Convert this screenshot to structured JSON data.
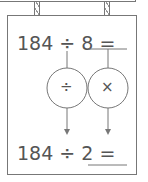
{
  "diagram": {
    "top_equation": "184 ÷ 8 =",
    "bottom_equation": "184 ÷ 2 =",
    "operations": [
      {
        "symbol": "÷",
        "name": "divide"
      },
      {
        "symbol": "×",
        "name": "multiply"
      }
    ],
    "colors": {
      "line": "#777777",
      "text": "#555555"
    }
  }
}
